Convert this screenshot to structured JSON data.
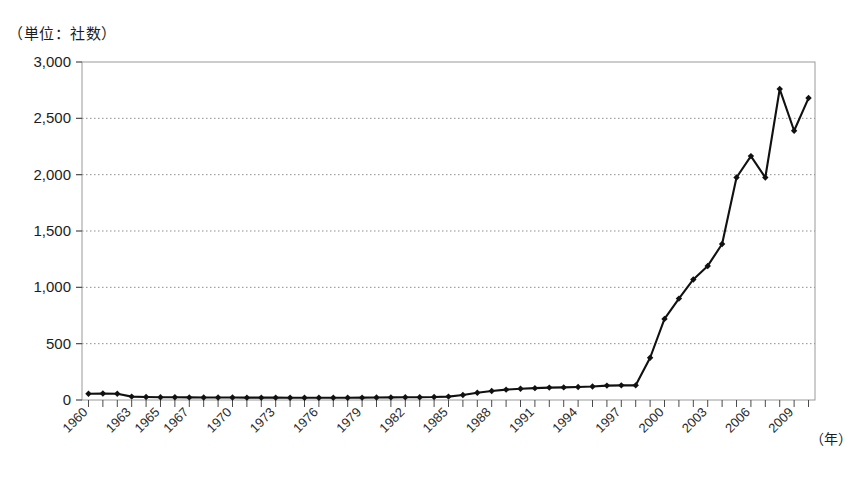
{
  "chart_data": {
    "type": "line",
    "title": "",
    "unit_note": "（単位：社数）",
    "xlabel": "（年）",
    "ylabel": "",
    "ylim": [
      0,
      3000
    ],
    "ytick_values": [
      0,
      500,
      1000,
      1500,
      2000,
      2500,
      3000
    ],
    "ytick_labels": [
      "0",
      "500",
      "1,000",
      "1,500",
      "2,000",
      "2,500",
      "3,000"
    ],
    "grid": true,
    "grid_style": "dotted-horizontal",
    "legend": "none",
    "marker": "diamond",
    "line_color": "#111111",
    "xtick_labels": [
      "1960",
      "1963",
      "1965",
      "1967",
      "1970",
      "1973",
      "1976",
      "1979",
      "1982",
      "1985",
      "1988",
      "1991",
      "1994",
      "1997",
      "2000",
      "2003",
      "2006",
      "2009"
    ],
    "xtick_label_years": [
      1960,
      1963,
      1965,
      1967,
      1970,
      1973,
      1976,
      1979,
      1982,
      1985,
      1988,
      1991,
      1994,
      1997,
      2000,
      2003,
      2006,
      2009
    ],
    "x": [
      1960,
      1961,
      1962,
      1963,
      1964,
      1965,
      1966,
      1967,
      1968,
      1969,
      1970,
      1971,
      1972,
      1973,
      1974,
      1975,
      1976,
      1977,
      1978,
      1979,
      1980,
      1981,
      1982,
      1983,
      1984,
      1985,
      1986,
      1987,
      1988,
      1989,
      1990,
      1991,
      1992,
      1993,
      1994,
      1995,
      1996,
      1997,
      1998,
      1999,
      2000,
      2001,
      2002,
      2003,
      2004,
      2005,
      2006,
      2007,
      2008,
      2009,
      2010
    ],
    "values": [
      55,
      58,
      55,
      30,
      27,
      25,
      24,
      23,
      22,
      22,
      22,
      21,
      21,
      21,
      20,
      20,
      20,
      20,
      20,
      21,
      22,
      23,
      24,
      25,
      26,
      30,
      45,
      65,
      80,
      92,
      100,
      105,
      110,
      112,
      115,
      120,
      128,
      130,
      130,
      375,
      720,
      900,
      1070,
      1190,
      1385,
      1975,
      2165,
      1975,
      2760,
      2390,
      2680
    ],
    "annotations": []
  }
}
